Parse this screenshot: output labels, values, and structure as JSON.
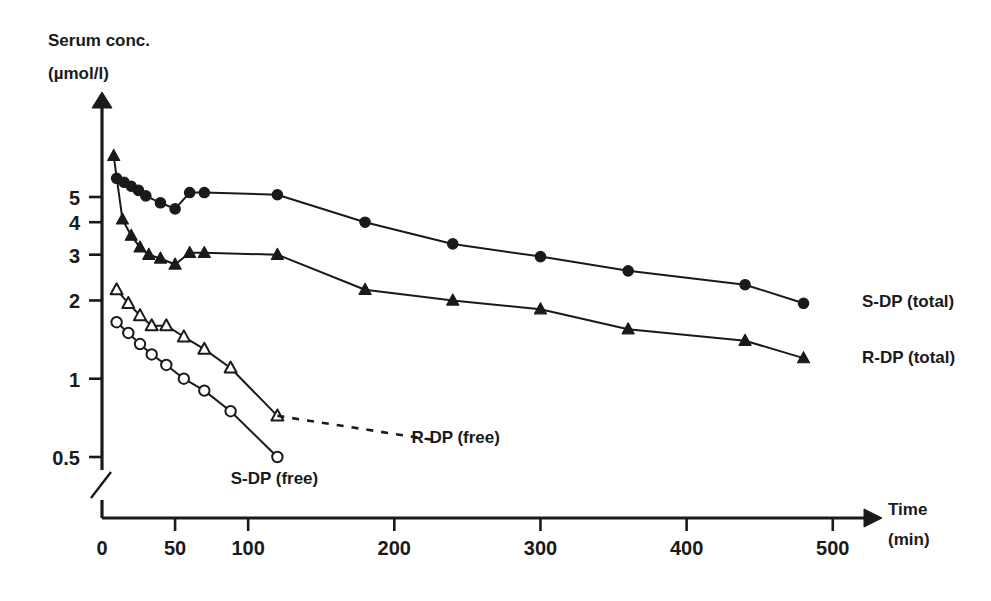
{
  "chart_data": {
    "type": "line",
    "title": "",
    "ylabel": "Serum conc.",
    "yunits": "(µmol/l)",
    "xlabel": "Time",
    "xunits": "(min)",
    "yscale": "log",
    "ylim": [
      0.45,
      8.0
    ],
    "xlim": [
      0,
      520
    ],
    "grid": false,
    "axis_break_y": true,
    "legend_position": "inline-right",
    "yticks": [
      5,
      4,
      3,
      2,
      1,
      0.5
    ],
    "ytick_labels": [
      "5",
      "4",
      "3",
      "2",
      "1",
      "0.5"
    ],
    "xticks": [
      0,
      50,
      100,
      200,
      300,
      400,
      500
    ],
    "xtick_labels": [
      "0",
      "50",
      "100",
      "200",
      "300",
      "400",
      "500"
    ],
    "series": [
      {
        "name": "S-DP (total)",
        "marker": "filled-circle",
        "linestyle": "solid",
        "label_x": 520,
        "label_y": 2.0,
        "x": [
          10,
          15,
          20,
          25,
          30,
          40,
          50,
          60,
          70,
          120,
          180,
          240,
          300,
          360,
          440,
          480
        ],
        "y": [
          5.9,
          5.7,
          5.5,
          5.3,
          5.05,
          4.75,
          4.5,
          5.2,
          5.2,
          5.1,
          4.0,
          3.3,
          2.95,
          2.6,
          2.3,
          1.95
        ]
      },
      {
        "name": "R-DP (total)",
        "marker": "filled-triangle",
        "linestyle": "solid",
        "label_x": 520,
        "label_y": 1.22,
        "x": [
          8,
          14,
          20,
          26,
          32,
          40,
          50,
          60,
          70,
          120,
          180,
          240,
          300,
          360,
          440,
          480
        ],
        "y": [
          7.2,
          4.1,
          3.55,
          3.2,
          3.0,
          2.9,
          2.75,
          3.05,
          3.05,
          3.0,
          2.2,
          2.0,
          1.85,
          1.55,
          1.4,
          1.2
        ]
      },
      {
        "name": "R-DP (free)",
        "marker": "open-triangle",
        "linestyle": "solid",
        "label_x": 242,
        "label_y": 0.6,
        "x": [
          10,
          18,
          26,
          34,
          44,
          56,
          70,
          88,
          120
        ],
        "y": [
          2.2,
          1.95,
          1.75,
          1.6,
          1.6,
          1.45,
          1.3,
          1.1,
          0.72
        ]
      },
      {
        "name": "S-DP (free)",
        "marker": "open-circle",
        "linestyle": "solid",
        "label_x": 118,
        "label_y": 0.42,
        "x": [
          10,
          18,
          26,
          34,
          44,
          56,
          70,
          88,
          120
        ],
        "y": [
          1.65,
          1.5,
          1.36,
          1.24,
          1.13,
          1.0,
          0.9,
          0.75,
          0.5
        ]
      }
    ],
    "annotations": [
      {
        "name": "r-dp-free-leader",
        "style": "dashed",
        "from_x": 120,
        "from_y": 0.72,
        "to_x": 228,
        "to_y": 0.58
      }
    ]
  }
}
